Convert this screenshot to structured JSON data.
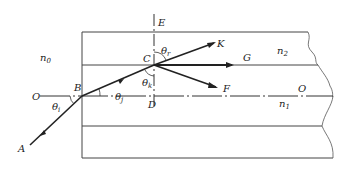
{
  "diagram": {
    "type": "optical fiber ray refraction",
    "points": {
      "A": "A",
      "B": "B",
      "C": "C",
      "D": "D",
      "E": "E",
      "F": "F",
      "G": "G",
      "K": "K",
      "O_left": "O",
      "O_right": "O"
    },
    "media": {
      "outside": "n",
      "outside_sub": "0",
      "cladding": "n",
      "cladding_sub": "2",
      "core": "n",
      "core_sub": "1"
    },
    "angles": {
      "incidence": "θ",
      "incidence_sub": "i",
      "refraction": "θ",
      "refraction_sub": "j",
      "critical": "θ",
      "critical_sub": "k",
      "transmitted": "θ",
      "transmitted_sub": "r"
    },
    "colors": {
      "line": "#333333",
      "ray": "#222222"
    }
  }
}
